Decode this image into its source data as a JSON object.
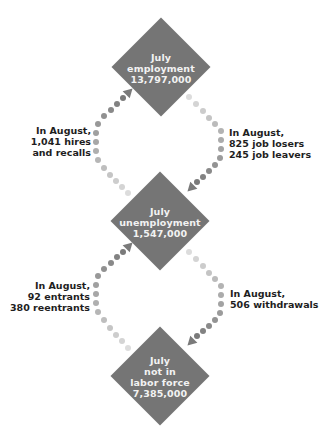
{
  "header_fragment": "g g",
  "nodes": {
    "employment": {
      "lines": [
        "July",
        "employment",
        "13,797,000"
      ],
      "value": 13797000
    },
    "unemployment": {
      "lines": [
        "July",
        "unemployment",
        "1,547,000"
      ],
      "value": 1547000
    },
    "not_in_labor_force": {
      "lines": [
        "July",
        "not in",
        "labor force",
        "7,385,000"
      ],
      "value": 7385000
    }
  },
  "flows": {
    "unemployment_to_employment": {
      "lines": [
        "In August,",
        "1,041 hires",
        "and recalls"
      ],
      "value_thousands": 1041
    },
    "employment_to_unemployment": {
      "lines": [
        "In August,",
        "825 job losers",
        "245 job leavers"
      ],
      "job_losers_thousands": 825,
      "job_leavers_thousands": 245
    },
    "not_in_lf_to_unemployment": {
      "lines": [
        "In August,",
        "92 entrants",
        "380 reentrants"
      ],
      "entrants_thousands": 92,
      "reentrants_thousands": 380
    },
    "unemployment_to_not_in_lf": {
      "lines": [
        "In August,",
        "506 withdrawals"
      ],
      "value_thousands": 506
    }
  },
  "colors": {
    "diamond": "#757575",
    "diamond_text": "#f2f2f2",
    "flow_text": "#1e1e1e",
    "dot_dark": "#7a7a7a",
    "dot_light": "#dcdcdc"
  }
}
